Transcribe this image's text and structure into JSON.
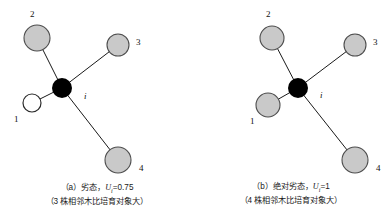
{
  "figure": {
    "background_color": "#ffffff",
    "edge_color": "#1a1a1a",
    "gray_node_fill": "#c9c9c9",
    "gray_node_stroke": "#4d4d4d",
    "white_node_fill": "#ffffff",
    "white_node_stroke": "#2b2b2b",
    "center_node_fill": "#000000"
  },
  "panels": [
    {
      "id": "a",
      "center": {
        "label": "i",
        "x": 62,
        "y": 88,
        "r": 10,
        "fill": "#000000"
      },
      "center_label_pos": {
        "x": 84,
        "y": 92
      },
      "neighbors": [
        {
          "label": "1",
          "x": 32,
          "y": 103,
          "r": 9,
          "fill": "white",
          "label_x": 14,
          "label_y": 115
        },
        {
          "label": "2",
          "x": 37,
          "y": 38,
          "r": 13,
          "fill": "gray",
          "label_x": 30,
          "label_y": 10
        },
        {
          "label": "3",
          "x": 118,
          "y": 45,
          "r": 11,
          "fill": "gray",
          "label_x": 136,
          "label_y": 38
        },
        {
          "label": "4",
          "x": 118,
          "y": 160,
          "r": 13,
          "fill": "gray",
          "label_x": 139,
          "label_y": 164
        }
      ],
      "caption_line1_prefix": "（a）劣态，",
      "caption_var": "U",
      "caption_sub": "i",
      "caption_value": "=0.75",
      "caption_line2": "（3 株相邻木比培育对象大）"
    },
    {
      "id": "b",
      "center": {
        "label": "i",
        "x": 104,
        "y": 88,
        "r": 10,
        "fill": "#000000"
      },
      "center_label_pos": {
        "x": 126,
        "y": 91
      },
      "neighbors": [
        {
          "label": "1",
          "x": 74,
          "y": 105,
          "r": 12,
          "fill": "gray",
          "label_x": 56,
          "label_y": 117
        },
        {
          "label": "2",
          "x": 78,
          "y": 38,
          "r": 12,
          "fill": "gray",
          "label_x": 72,
          "label_y": 10
        },
        {
          "label": "3",
          "x": 161,
          "y": 45,
          "r": 11,
          "fill": "gray",
          "label_x": 179,
          "label_y": 38
        },
        {
          "label": "4",
          "x": 161,
          "y": 160,
          "r": 13,
          "fill": "gray",
          "label_x": 182,
          "label_y": 164
        }
      ],
      "caption_line1_prefix": "（b）绝对劣态，",
      "caption_var": "U",
      "caption_sub": "i",
      "caption_value": "=1",
      "caption_line2": "（4 株相邻木比培育对象大）"
    }
  ]
}
